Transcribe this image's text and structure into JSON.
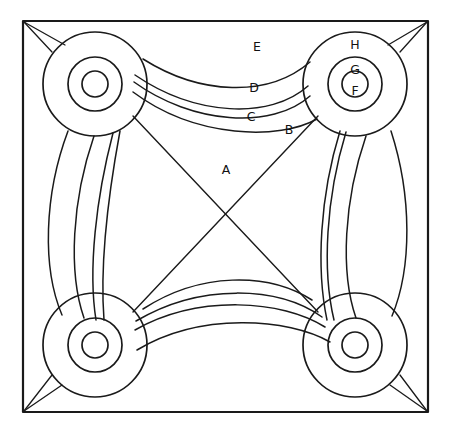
{
  "figure": {
    "background_color": "#ffffff",
    "line_color": "#1a1a1a",
    "frame": {
      "name": "outer-square-frame",
      "corners": [
        [
          23,
          21
        ],
        [
          428,
          21
        ],
        [
          428,
          412
        ],
        [
          23,
          412
        ]
      ],
      "stroke_width": 2.2
    },
    "nodes": [
      {
        "id": "top-left",
        "name": "ring-group-top-left",
        "cx": 95,
        "cy": 84,
        "radii": [
          52,
          27,
          13
        ],
        "labels": []
      },
      {
        "id": "top-right",
        "name": "ring-group-top-right",
        "cx": 355,
        "cy": 84,
        "radii": [
          52,
          27,
          13
        ],
        "labels": [
          {
            "text": "H",
            "x": 355,
            "y": 45
          },
          {
            "text": "G",
            "x": 355,
            "y": 70
          },
          {
            "text": "F",
            "x": 355,
            "y": 91
          }
        ]
      },
      {
        "id": "bottom-left",
        "name": "ring-group-bottom-left",
        "cx": 95,
        "cy": 345,
        "radii": [
          52,
          27,
          13
        ],
        "labels": []
      },
      {
        "id": "bottom-right",
        "name": "ring-group-bottom-right",
        "cx": 355,
        "cy": 345,
        "radii": [
          52,
          27,
          13
        ],
        "labels": []
      }
    ],
    "band_labels": [
      {
        "text": "E",
        "x": 257,
        "y": 47
      },
      {
        "text": "D",
        "x": 254,
        "y": 88
      },
      {
        "text": "C",
        "x": 251,
        "y": 117
      },
      {
        "text": "B",
        "x": 289,
        "y": 130
      },
      {
        "text": "A",
        "x": 226,
        "y": 170
      }
    ],
    "band_paths": {
      "top": [
        "M 143 59 C 200 95, 268 98, 310 62",
        "M 135 75 C 195 116, 270 120, 308 86",
        "M 134 82 C 192 124, 272 130, 310 96",
        "M 133 92 C 196 139, 280 140, 317 119"
      ],
      "left": [
        "M 68 131 C 44 195, 42 268, 62 315",
        "M 94 136 C 72 200, 68 272, 84 318",
        "M 113 133 C 96 198, 88 270, 96 320",
        "M 120 131 C 108 196, 100 268, 104 320"
      ],
      "right": [
        "M 391 131 C 412 196, 412 268, 392 316",
        "M 366 136 C 344 200, 340 272, 356 318",
        "M 346 132 C 326 198, 322 270, 334 320",
        "M 340 131 C 320 196, 316 268, 327 320"
      ],
      "bottom": [
        "M 143 309 C 200 272, 268 272, 312 300",
        "M 136 321 C 200 283, 278 286, 322 317",
        "M 135 330 C 199 294, 282 300, 325 327",
        "M 137 350 C 200 312, 288 318, 330 342"
      ]
    },
    "diagonals": [
      "M 133 116 L 318 312",
      "M 318 116 L 133 312"
    ],
    "corner_lines": [
      "M 24 22 L 65 45",
      "M 24 22 L 52 52",
      "M 427 22 L 388 45",
      "M 427 22 L 400 52",
      "M 24 411 L 62 385",
      "M 24 411 L 52 375",
      "M 427 411 L 390 385",
      "M 427 411 L 400 375"
    ]
  }
}
